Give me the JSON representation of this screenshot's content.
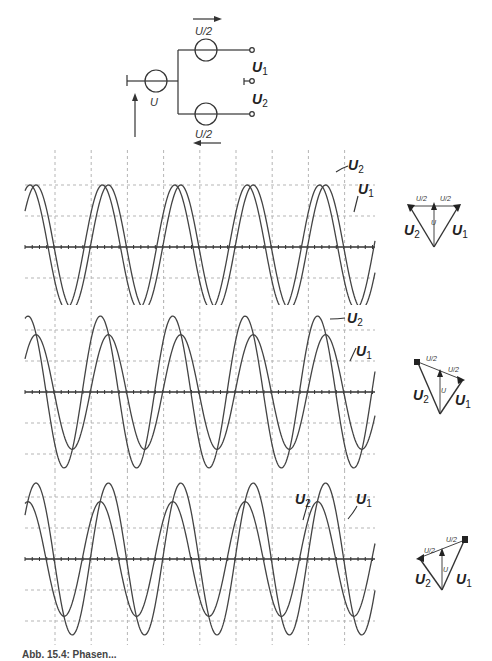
{
  "circuit": {
    "source_label": "U",
    "top_source_label": "U/2",
    "bottom_source_label": "U/2",
    "output1_label": "U",
    "output1_sub": "1",
    "output2_label": "U",
    "output2_sub": "2"
  },
  "panels": [
    {
      "id": "panel-1",
      "trace_labels": {
        "u2": "U",
        "u2_sub": "2",
        "u1": "U",
        "u1_sub": "1"
      },
      "phasor": {
        "half_label_left": "U/2",
        "half_label_right": "U/2",
        "u_label": "U",
        "u1_label": "U",
        "u1_sub": "1",
        "u2_label": "U",
        "u2_sub": "2"
      }
    },
    {
      "id": "panel-2",
      "trace_labels": {
        "u2": "U",
        "u2_sub": "2",
        "u1": "U",
        "u1_sub": "1"
      },
      "phasor": {
        "half_label_left": "U/2",
        "half_label_right": "U/2",
        "u_label": "U",
        "u1_label": "U",
        "u1_sub": "1",
        "u2_label": "U",
        "u2_sub": "2"
      }
    },
    {
      "id": "panel-3",
      "trace_labels": {
        "u2": "U",
        "u2_sub": "2",
        "u1": "U",
        "u1_sub": "1"
      },
      "phasor": {
        "half_label_left": "U/2",
        "half_label_right": "U/2",
        "u_label": "U",
        "u1_label": "U",
        "u1_sub": "1",
        "u2_label": "U",
        "u2_sub": "2"
      }
    }
  ],
  "chart_data": [
    {
      "type": "line",
      "title": "Oscillogram 1: U1 and U2 equal amplitude",
      "xlabel": "",
      "ylabel": "",
      "grid": true,
      "x_divisions": 10,
      "y_divisions": 4,
      "period_divisions": 2,
      "series": [
        {
          "name": "U2",
          "amplitude_div": 2.0,
          "phase_deg": 30
        },
        {
          "name": "U1",
          "amplitude_div": 2.0,
          "phase_deg": 0
        }
      ]
    },
    {
      "type": "line",
      "title": "Oscillogram 2: U2 larger than U1",
      "xlabel": "",
      "ylabel": "",
      "grid": true,
      "x_divisions": 10,
      "y_divisions": 4,
      "period_divisions": 2,
      "series": [
        {
          "name": "U2",
          "amplitude_div": 2.45,
          "phase_deg": 40
        },
        {
          "name": "U1",
          "amplitude_div": 1.85,
          "phase_deg": 0
        }
      ]
    },
    {
      "type": "line",
      "title": "Oscillogram 3: U1 larger than U2",
      "xlabel": "",
      "ylabel": "",
      "grid": true,
      "x_divisions": 10,
      "y_divisions": 4,
      "period_divisions": 2,
      "series": [
        {
          "name": "U2",
          "amplitude_div": 1.85,
          "phase_deg": 40
        },
        {
          "name": "U1",
          "amplitude_div": 2.45,
          "phase_deg": 0
        }
      ]
    }
  ],
  "caption": "Abb. 15.4: Phasen..."
}
